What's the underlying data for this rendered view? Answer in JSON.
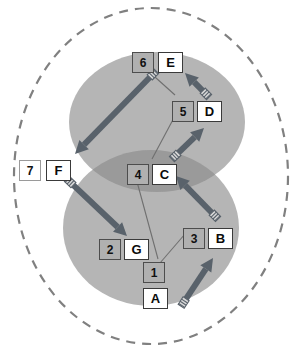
{
  "diagram": {
    "type": "venn-flow",
    "canvas": {
      "width": 300,
      "height": 351,
      "background": "#ffffff"
    },
    "colors": {
      "outer_boundary_stroke": "#808080",
      "set_fill": "#b5b5b5",
      "overlap_fill": "#9a9a9a",
      "arrow_fill": "#59626b",
      "connector_stroke": "#6f6f6f",
      "box_number_fill": "#b0b0b0",
      "box_letter_fill": "#ffffff",
      "box_border_dark": "#3a3a3a",
      "box_border_light": "#9a9a9a",
      "text": "#000000"
    },
    "outer_boundary": {
      "name": "universe-boundary",
      "shape": "ellipse",
      "cx": 151,
      "cy": 176,
      "rx": 137,
      "ry": 168,
      "stroke_style": "dashed"
    },
    "sets": [
      {
        "id": "set-upper",
        "label": "",
        "cx": 157,
        "cy": 122,
        "rx": 88,
        "ry": 70
      },
      {
        "id": "set-lower",
        "label": "",
        "cx": 151,
        "cy": 228,
        "rx": 88,
        "ry": 78
      }
    ],
    "nodes": [
      {
        "id": "A",
        "letter": "A",
        "number": "1",
        "letter_x": 143,
        "letter_y": 288,
        "number_x": 143,
        "number_y": 262,
        "number_style": "dark",
        "letter_style": "dark",
        "layout": "stacked"
      },
      {
        "id": "B",
        "letter": "B",
        "number": "3",
        "letter_x": 208,
        "letter_y": 228,
        "number_x": 183,
        "number_y": 228,
        "number_style": "dark",
        "letter_style": "dark",
        "layout": "side"
      },
      {
        "id": "C",
        "letter": "C",
        "number": "4",
        "letter_x": 152,
        "letter_y": 164,
        "number_x": 127,
        "number_y": 164,
        "number_style": "dark",
        "letter_style": "dark",
        "layout": "side"
      },
      {
        "id": "D",
        "letter": "D",
        "number": "5",
        "letter_x": 197,
        "letter_y": 101,
        "number_x": 172,
        "number_y": 101,
        "number_style": "dark",
        "letter_style": "dark",
        "layout": "side"
      },
      {
        "id": "E",
        "letter": "E",
        "number": "6",
        "letter_x": 158,
        "letter_y": 52,
        "number_x": 132,
        "number_y": 52,
        "number_style": "dark",
        "letter_style": "dark",
        "layout": "side"
      },
      {
        "id": "F",
        "letter": "F",
        "number": "7",
        "letter_x": 46,
        "letter_y": 160,
        "number_x": 19,
        "number_y": 160,
        "number_style": "light",
        "letter_style": "dark",
        "layout": "side"
      },
      {
        "id": "G",
        "letter": "G",
        "number": "2",
        "letter_x": 124,
        "letter_y": 239,
        "number_x": 99,
        "number_y": 239,
        "number_style": "dark",
        "letter_style": "dark",
        "layout": "side"
      }
    ],
    "arrows": [
      {
        "id": "arrow-A-to-B",
        "from": "A",
        "to": "B",
        "x1": 182,
        "y1": 305,
        "x2": 213,
        "y2": 258
      },
      {
        "id": "arrow-B-to-C",
        "from": "B",
        "to": "C",
        "x1": 217,
        "y1": 218,
        "x2": 176,
        "y2": 176
      },
      {
        "id": "arrow-C-to-D",
        "from": "C",
        "to": "D",
        "x1": 173,
        "y1": 158,
        "x2": 204,
        "y2": 128
      },
      {
        "id": "arrow-D-to-E",
        "from": "D",
        "to": "E",
        "x1": 208,
        "y1": 96,
        "x2": 185,
        "y2": 73
      },
      {
        "id": "arrow-E-to-F",
        "from": "E",
        "to": "F",
        "x1": 155,
        "y1": 72,
        "x2": 75,
        "y2": 154
      },
      {
        "id": "arrow-F-to-G",
        "from": "F",
        "to": "G",
        "x1": 68,
        "y1": 180,
        "x2": 127,
        "y2": 236
      }
    ],
    "connectors": [
      {
        "id": "connector-1-to-3",
        "from": "1",
        "to": "3",
        "x1": 160,
        "y1": 263,
        "x2": 185,
        "y2": 234
      },
      {
        "id": "connector-4-to-1",
        "from": "4",
        "to": "1",
        "x1": 136,
        "y1": 178,
        "x2": 158,
        "y2": 259
      },
      {
        "id": "connector-5-to-4",
        "from": "5",
        "to": "4",
        "x1": 176,
        "y1": 114,
        "x2": 152,
        "y2": 159
      },
      {
        "id": "connector-6-to-5",
        "from": "6",
        "to": "5",
        "x1": 146,
        "y1": 69,
        "x2": 175,
        "y2": 95
      }
    ]
  }
}
